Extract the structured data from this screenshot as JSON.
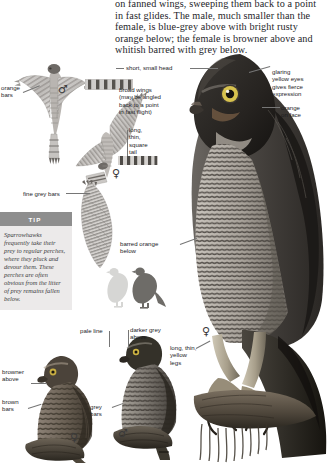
{
  "page": {
    "species": "Sparrowhawk",
    "intro_text": "on fanned wings, sweeping them back to a point in fast glides. The male, much smaller than the female, is blue-grey above with bright rusty orange below; the female is browner above and whitish barred with grey below."
  },
  "tip": {
    "heading": "TIP",
    "body": "Sparrowhawks frequently take their prey to regular perches, where they pluck and devour them. These perches are often obvious from the litter of prey remains fallen below."
  },
  "labels": {
    "orange_bars": "orange\nbars",
    "short_small_head": "short, small head",
    "broad_wings": "broad wings\n(may be angled\nback to a point\nin fast flight)",
    "long_thin_square_tail": "long,\nthin,\nsquare\ntail",
    "glaring_eyes": "glaring\nyellow eyes\ngives fierce\nexpression",
    "orange_on_face": "orange\non face",
    "fine_grey_bars": "fine grey bars",
    "barred_orange_below": "barred orange\nbelow",
    "pale_line": "pale line",
    "darker_grey_above": "darker grey\nabove",
    "long_thin_yellow_legs": "long, thin,\nyellow\nlegs",
    "browner_above": "browner\nabove",
    "brown_bars": "brown\nbars",
    "grey_bars": "grey\nbars"
  },
  "symbols": {
    "male": "♂",
    "female": "♀"
  },
  "figures": {
    "flight_male": "male-sparrowhawk-in-flight-underside",
    "flight_female": "female-sparrowhawk-in-flight-underside",
    "tail_detail": "barred-tail-detail",
    "portrait_female": "female-sparrowhawk-head-and-breast-portrait",
    "prey_silhouettes": "two-pigeon-prey-silhouettes",
    "perched_male": "perched-male-sparrowhawk",
    "perched_female": "perched-female-sparrowhawk",
    "talons": "sparrowhawk-talons-gripping-branch"
  },
  "colors": {
    "tip_header": "#8e8e8e",
    "tip_body_bg": "#eceaea",
    "leader_line": "#767676",
    "text": "#1d1d1f"
  }
}
